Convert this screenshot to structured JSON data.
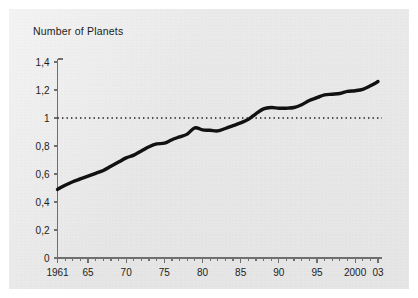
{
  "figure": {
    "background_color": "#ffffff",
    "panel_color": "#e9e9e9",
    "ink_color": "#111111"
  },
  "chart_data": {
    "type": "line",
    "title": "Number of Planets",
    "subtitle": "",
    "xlabel": "",
    "ylabel": "",
    "xlim": [
      1961,
      2003
    ],
    "ylim": [
      0,
      1.4
    ],
    "grid": false,
    "legend": null,
    "decimal_separator": ",",
    "y_ticks": [
      0,
      0.2,
      0.4,
      0.6,
      0.8,
      1,
      1.2,
      1.4
    ],
    "y_tick_labels": [
      "0",
      "0,2",
      "0,4",
      "0,6",
      "0,8",
      "1",
      "1,2",
      "1,4"
    ],
    "x_ticks": [
      1961,
      1965,
      1970,
      1975,
      1980,
      1985,
      1990,
      1995,
      2000,
      2003
    ],
    "x_tick_labels": [
      "1961",
      "65",
      "70",
      "75",
      "80",
      "85",
      "90",
      "95",
      "2000",
      "03"
    ],
    "x_minor_ticks": [
      1961,
      1962,
      1963,
      1964,
      1965,
      1966,
      1967,
      1968,
      1969,
      1970,
      1971,
      1972,
      1973,
      1974,
      1975,
      1976,
      1977,
      1978,
      1979,
      1980,
      1981,
      1982,
      1983,
      1984,
      1985,
      1986,
      1987,
      1988,
      1989,
      1990,
      1991,
      1992,
      1993,
      1994,
      1995,
      1996,
      1997,
      1998,
      1999,
      2000,
      2001,
      2002,
      2003
    ],
    "annotations": [
      {
        "name": "reference-line-one-planet",
        "type": "hline",
        "value": 1,
        "style": "dotted",
        "color": "#1a1a1a",
        "label": ""
      }
    ],
    "series": [
      {
        "name": "Number of Planets",
        "color": "#111111",
        "line_width": 3.4,
        "x": [
          1961,
          1962,
          1963,
          1964,
          1965,
          1966,
          1967,
          1968,
          1969,
          1970,
          1971,
          1972,
          1973,
          1974,
          1975,
          1976,
          1977,
          1978,
          1979,
          1980,
          1981,
          1982,
          1983,
          1984,
          1985,
          1986,
          1987,
          1988,
          1989,
          1990,
          1991,
          1992,
          1993,
          1994,
          1995,
          1996,
          1997,
          1998,
          1999,
          2000,
          2001,
          2002,
          2003
        ],
        "values": [
          0.49,
          0.52,
          0.545,
          0.565,
          0.585,
          0.605,
          0.625,
          0.655,
          0.685,
          0.715,
          0.735,
          0.765,
          0.795,
          0.815,
          0.82,
          0.845,
          0.865,
          0.885,
          0.93,
          0.915,
          0.912,
          0.908,
          0.925,
          0.945,
          0.965,
          0.99,
          1.03,
          1.065,
          1.075,
          1.07,
          1.07,
          1.075,
          1.095,
          1.125,
          1.145,
          1.165,
          1.17,
          1.175,
          1.19,
          1.195,
          1.205,
          1.23,
          1.26
        ]
      }
    ]
  }
}
